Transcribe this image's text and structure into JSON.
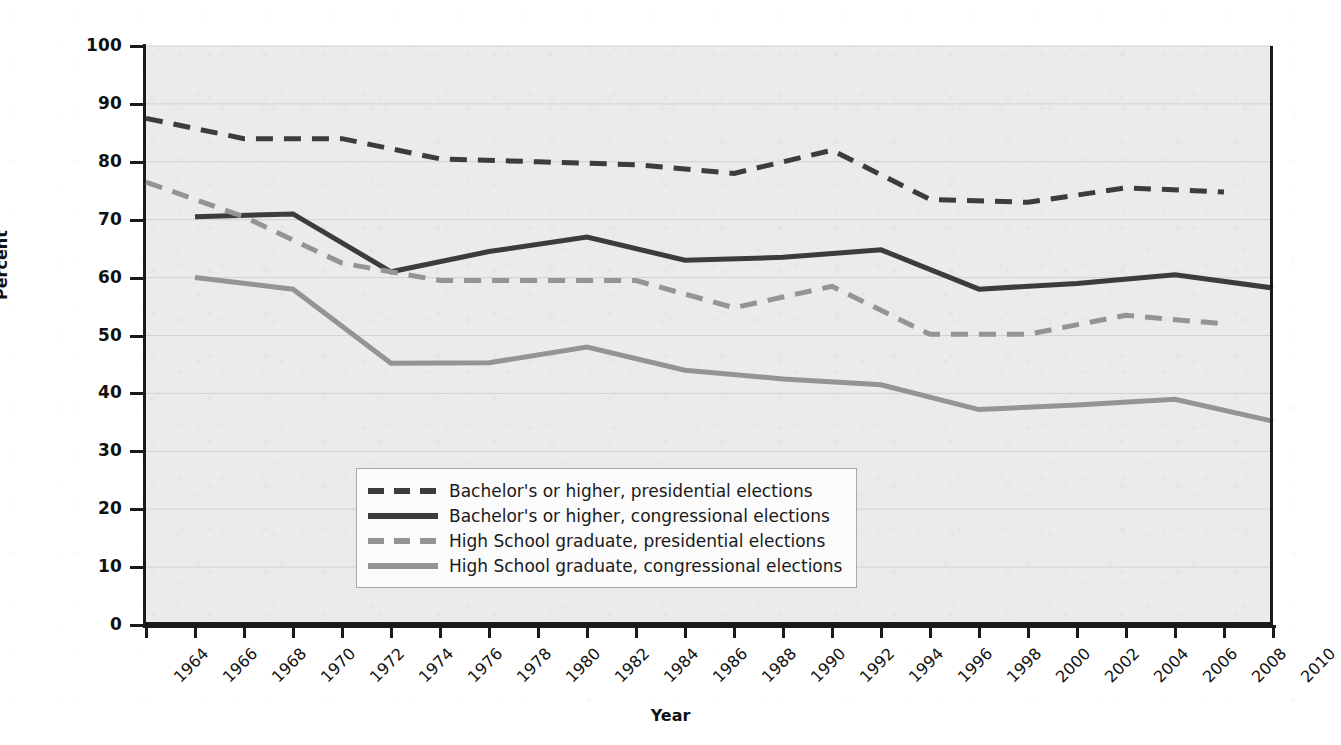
{
  "chart_data": {
    "type": "line",
    "title": "",
    "xlabel": "Year",
    "ylabel": "Percent",
    "ylim": [
      0,
      100
    ],
    "ytick_step": 10,
    "yticks": [
      0,
      10,
      20,
      30,
      40,
      50,
      60,
      70,
      80,
      90,
      100
    ],
    "xlim": [
      1964,
      2010
    ],
    "xtick_step": 2,
    "categories": [
      1964,
      1966,
      1968,
      1970,
      1972,
      1974,
      1976,
      1978,
      1980,
      1982,
      1984,
      1986,
      1988,
      1990,
      1992,
      1994,
      1996,
      1998,
      2000,
      2002,
      2004,
      2006,
      2008,
      2010
    ],
    "xtick_labels": [
      "1964",
      "1966",
      "1968",
      "1970",
      "1972",
      "1974",
      "1976",
      "1978",
      "1980",
      "1982",
      "1984",
      "1986",
      "1988",
      "1990",
      "1992",
      "1994",
      "1996",
      "1998",
      "2000",
      "2002",
      "2004",
      "2006",
      "2008",
      "2010"
    ],
    "grid": "horizontal",
    "legend_position": "inside lower-left",
    "series": [
      {
        "name": "Bachelor's or higher, presidential elections",
        "style": "dashed",
        "color": "#3c3c3c",
        "x": [
          1964,
          1968,
          1972,
          1976,
          1980,
          1984,
          1988,
          1992,
          1996,
          2000,
          2004,
          2008
        ],
        "values": [
          87.5,
          84.0,
          84.0,
          80.5,
          80.0,
          79.5,
          78.0,
          82.0,
          73.5,
          73.0,
          75.5,
          74.8
        ]
      },
      {
        "name": "Bachelor's or higher, congressional elections",
        "style": "solid",
        "color": "#3c3c3c",
        "x": [
          1966,
          1970,
          1974,
          1978,
          1982,
          1986,
          1990,
          1994,
          1998,
          2002,
          2006,
          2010
        ],
        "values": [
          70.5,
          71.0,
          61.0,
          64.5,
          67.0,
          63.0,
          63.5,
          64.8,
          58.0,
          59.0,
          60.5,
          58.2
        ]
      },
      {
        "name": "High School graduate, presidential elections",
        "style": "dashed",
        "color": "#949494",
        "x": [
          1964,
          1968,
          1972,
          1976,
          1980,
          1984,
          1988,
          1992,
          1996,
          2000,
          2004,
          2008
        ],
        "values": [
          76.5,
          70.5,
          62.5,
          59.5,
          59.5,
          59.5,
          54.8,
          58.5,
          50.2,
          50.2,
          53.5,
          52.0
        ]
      },
      {
        "name": "High School graduate, congressional elections",
        "style": "solid",
        "color": "#949494",
        "x": [
          1966,
          1970,
          1974,
          1978,
          1982,
          1986,
          1990,
          1994,
          1998,
          2002,
          2006,
          2010
        ],
        "values": [
          60.0,
          58.0,
          45.2,
          45.3,
          48.0,
          44.0,
          42.5,
          41.5,
          37.2,
          38.0,
          39.0,
          35.2
        ]
      }
    ]
  },
  "legend": {
    "entries": [
      {
        "label": "Bachelor's or higher, presidential elections",
        "color": "#3c3c3c",
        "style": "dashed"
      },
      {
        "label": "Bachelor's or higher, congressional elections",
        "color": "#3c3c3c",
        "style": "solid"
      },
      {
        "label": "High School graduate, presidential elections",
        "color": "#949494",
        "style": "dashed"
      },
      {
        "label": "High School graduate, congressional elections",
        "color": "#949494",
        "style": "solid"
      }
    ]
  },
  "colors": {
    "plot_background": "#ebebeb",
    "page_background": "#ffffff",
    "axis": "#1a1a1a",
    "gridline": "#d2d2d2",
    "dark_series": "#3c3c3c",
    "light_series": "#949494"
  }
}
